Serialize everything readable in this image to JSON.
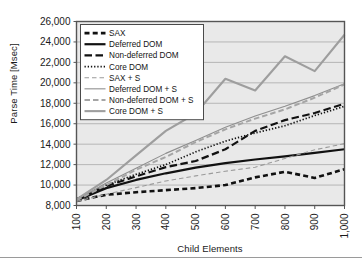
{
  "chart_data": {
    "type": "line",
    "title": "",
    "xlabel": "Child Elements",
    "ylabel": "Parse Time [Msec]",
    "categories": [
      "100",
      "200",
      "300",
      "400",
      "500",
      "600",
      "700",
      "800",
      "900",
      "1,000"
    ],
    "x_tick_rotation": -90,
    "ylim": [
      8000,
      26000
    ],
    "y_ticks": [
      "8,000",
      "10,000",
      "12,000",
      "14,000",
      "16,000",
      "18,000",
      "20,000",
      "22,000",
      "24,000",
      "26,000"
    ],
    "y_tick_values": [
      8000,
      10000,
      12000,
      14000,
      16000,
      18000,
      20000,
      22000,
      24000,
      26000
    ],
    "grid": "horizontal",
    "legend_position": "top-left-inside",
    "plot_bg": "#e9e9e9",
    "grid_color": "#a8a8a8",
    "frame_color": "#555555",
    "series": [
      {
        "name": "SAX",
        "style": "thick-dash",
        "color": "#111111",
        "values": [
          8450,
          9050,
          9300,
          9500,
          9700,
          10000,
          10750,
          11300,
          10700,
          11550
        ]
      },
      {
        "name": "Deferred DOM",
        "style": "thick-solid",
        "color": "#111111",
        "values": [
          8500,
          9700,
          10500,
          11150,
          11700,
          12150,
          12500,
          12800,
          13150,
          13500
        ]
      },
      {
        "name": "Non-deferred DOM",
        "style": "long-dash",
        "color": "#111111",
        "values": [
          8600,
          9900,
          10850,
          11750,
          12350,
          13500,
          15300,
          16350,
          17050,
          17950
        ]
      },
      {
        "name": "Core DOM",
        "style": "dotted",
        "color": "#111111",
        "values": [
          8650,
          10000,
          11050,
          12000,
          13250,
          14300,
          15100,
          15800,
          16800,
          17700
        ]
      },
      {
        "name": "SAX + S",
        "style": "thin-dash",
        "color": "#9b9b9b",
        "values": [
          8400,
          9100,
          9750,
          10400,
          10900,
          11350,
          11750,
          12600,
          13450,
          14050
        ]
      },
      {
        "name": "Deferred DOM + S",
        "style": "thin-solid-gray",
        "color": "#8f8f8f",
        "values": [
          8550,
          10200,
          11650,
          13100,
          14350,
          15650,
          16750,
          17700,
          18750,
          19900
        ]
      },
      {
        "name": "Non-deferred DOM + S",
        "style": "gray-dash",
        "color": "#a5a5a5",
        "values": [
          8500,
          10000,
          11500,
          12750,
          14200,
          15450,
          16500,
          17400,
          18550,
          19850
        ]
      },
      {
        "name": "Core DOM + S",
        "style": "thick-solid-gray",
        "color": "#9e9e9e",
        "values": [
          8600,
          10500,
          12900,
          15300,
          17000,
          20400,
          19250,
          22600,
          21150,
          24700
        ]
      }
    ]
  }
}
